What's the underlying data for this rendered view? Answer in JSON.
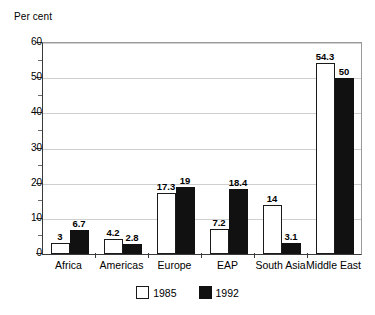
{
  "chart_data": {
    "type": "bar",
    "title": "",
    "xlabel": "",
    "ylabel": "Per cent",
    "ylim": [
      0,
      60
    ],
    "ytick_step": 10,
    "yticks": [
      0,
      10,
      20,
      30,
      40,
      50,
      60
    ],
    "ytick_labels": [
      "0",
      "10",
      "20",
      "30",
      "40",
      "50",
      "60"
    ],
    "minor_ytick_step": 5,
    "grid": true,
    "grid_axis": "y",
    "legend_position": "bottom-center",
    "categories": [
      "Africa",
      "Americas",
      "Europe",
      "EAP",
      "South Asia",
      "Middle East"
    ],
    "series": [
      {
        "name": "1985",
        "color": "#ffffff",
        "edge_color": "#1a1a1a",
        "values": [
          3,
          4.2,
          17.3,
          7.2,
          14,
          54.3
        ],
        "value_labels": [
          "3",
          "4.2",
          "17.3",
          "7.2",
          "14",
          "54.3"
        ]
      },
      {
        "name": "1992",
        "color": "#111111",
        "edge_color": "#111111",
        "values": [
          6.7,
          2.8,
          19,
          18.4,
          3.1,
          50
        ],
        "value_labels": [
          "6.7",
          "2.8",
          "19",
          "18.4",
          "3.1",
          "50"
        ]
      }
    ]
  },
  "axis": {
    "y_title": "Per cent",
    "tick_labels": [
      "60",
      "50",
      "40",
      "30",
      "20",
      "10",
      "0"
    ],
    "category_labels": [
      "Africa",
      "Americas",
      "Europe",
      "EAP",
      "South Asia",
      "Middle East"
    ]
  },
  "legend": {
    "items": [
      {
        "label": "1985",
        "swatch": "white-square-swatch"
      },
      {
        "label": "1992",
        "swatch": "black-square-swatch"
      }
    ]
  },
  "colors": {
    "series_1985": "#ffffff",
    "series_1992": "#111111",
    "axis": "#3a3a3a",
    "grid": "#cfcfcf",
    "text": "#000000",
    "background": "#ffffff"
  }
}
